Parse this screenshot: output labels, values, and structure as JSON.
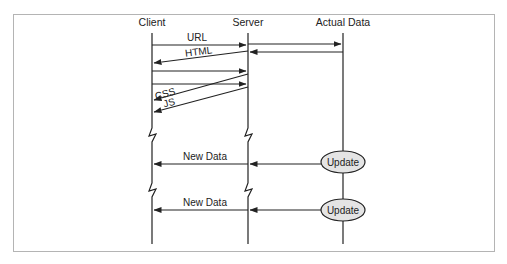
{
  "diagram": {
    "type": "sequence",
    "participants": [
      {
        "id": "client",
        "label": "Client"
      },
      {
        "id": "server",
        "label": "Server"
      },
      {
        "id": "data",
        "label": "Actual Data"
      }
    ],
    "messages": [
      {
        "from": "client",
        "to": "server",
        "label": "URL"
      },
      {
        "from": "server",
        "to": "data",
        "label": ""
      },
      {
        "from": "data",
        "to": "server",
        "label": ""
      },
      {
        "from": "server",
        "to": "client",
        "label": "HTML"
      },
      {
        "from": "client",
        "to": "server",
        "label": ""
      },
      {
        "from": "client",
        "to": "server",
        "label": ""
      },
      {
        "from": "server",
        "to": "client",
        "label": "CSS"
      },
      {
        "from": "server",
        "to": "client",
        "label": "JS"
      },
      {
        "from": "data",
        "to": "client",
        "label": "New Data",
        "via": "server"
      },
      {
        "from": "data",
        "to": "client",
        "label": "New Data",
        "via": "server"
      }
    ],
    "events": [
      {
        "participant": "data",
        "label": "Update"
      },
      {
        "participant": "data",
        "label": "Update"
      }
    ],
    "colors": {
      "line": "#222222",
      "event_fill": "#e4e4e4",
      "frame": "#b4b4b4"
    }
  }
}
